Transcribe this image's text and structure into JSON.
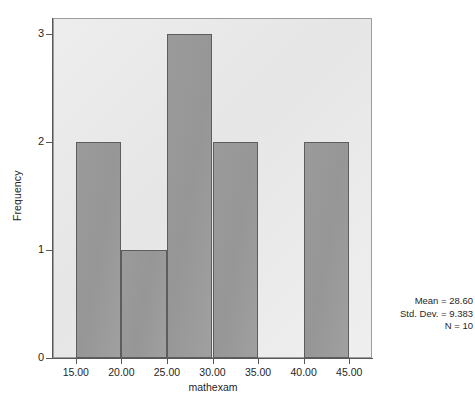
{
  "chart_data": {
    "type": "bar",
    "chart_subtype": "histogram",
    "title": "",
    "xlabel": "mathexam",
    "ylabel": "Frequency",
    "xlim": [
      12.5,
      47.5
    ],
    "ylim": [
      0,
      3.15
    ],
    "grid": false,
    "legend": "none",
    "bin_width": 5,
    "x_tick_labels": [
      "15.00",
      "20.00",
      "25.00",
      "30.00",
      "35.00",
      "40.00",
      "45.00"
    ],
    "x_tick_values": [
      15,
      20,
      25,
      30,
      35,
      40,
      45
    ],
    "y_tick_labels": [
      "0",
      "1",
      "2",
      "3"
    ],
    "y_tick_values": [
      0,
      1,
      2,
      3
    ],
    "categories": [
      "15-20",
      "20-25",
      "25-30",
      "30-35",
      "35-40",
      "40-45"
    ],
    "bins": [
      {
        "label": "15-20",
        "start": 15,
        "end": 20,
        "value": 2
      },
      {
        "label": "20-25",
        "start": 20,
        "end": 25,
        "value": 1
      },
      {
        "label": "25-30",
        "start": 25,
        "end": 30,
        "value": 3
      },
      {
        "label": "30-35",
        "start": 30,
        "end": 35,
        "value": 2
      },
      {
        "label": "35-40",
        "start": 35,
        "end": 40,
        "value": 0
      },
      {
        "label": "40-45",
        "start": 40,
        "end": 45,
        "value": 2
      }
    ],
    "values": [
      2,
      1,
      3,
      2,
      0,
      2
    ],
    "colors": {
      "bar_fill": "#9a9a9a",
      "bar_edge": "#5d5d5d",
      "plot_background": "#eaeaea",
      "frame": "#9d9d9d",
      "axis": "#58585a",
      "text": "#1f1f1f",
      "page_background": "#ffffff"
    }
  },
  "annotation": {
    "mean_line": "Mean = 28.60",
    "stddev_line": "Std. Dev. = 9.383",
    "n_line": "N = 10",
    "mean": "28.60",
    "std_dev": "9.383",
    "n": "10"
  }
}
